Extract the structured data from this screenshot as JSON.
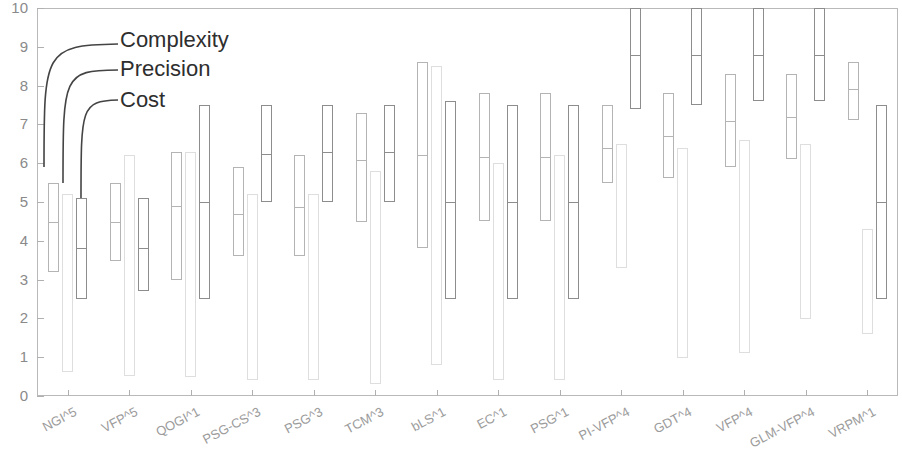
{
  "chart_data": {
    "type": "bar",
    "title": "",
    "xlabel": "",
    "ylabel": "",
    "ylim": [
      0,
      10
    ],
    "yticks": [
      "0",
      "1",
      "2",
      "3",
      "4",
      "5",
      "6",
      "7",
      "8",
      "9",
      "10"
    ],
    "grid": false,
    "legend_position": "upper-left-inside",
    "legend": [
      "Complexity",
      "Precision",
      "Cost"
    ],
    "series_colors": {
      "Complexity": "#b4b4b4",
      "Cost": "#dedede",
      "Precision": "#8d8d8d"
    },
    "bar_order": [
      "Complexity",
      "Cost",
      "Precision"
    ],
    "categories": [
      "NGI^5",
      "VFP^5",
      "QOGI^1",
      "PSG-CS^3",
      "PSG^3",
      "TCM^3",
      "bLS^1",
      "EC^1",
      "PSG^1",
      "PI-VFP^4",
      "GDT^4",
      "VFP^4",
      "GLM-VFP^4",
      "VRPM^1"
    ],
    "series": [
      {
        "name": "Complexity",
        "boxes": [
          {
            "low": 3.2,
            "high": 5.5,
            "median": 4.5
          },
          {
            "low": 3.5,
            "high": 5.5,
            "median": 4.5
          },
          {
            "low": 3.0,
            "high": 6.3,
            "median": 4.9
          },
          {
            "low": 3.6,
            "high": 5.9,
            "median": 4.7
          },
          {
            "low": 3.6,
            "high": 6.2,
            "median": 4.85
          },
          {
            "low": 4.5,
            "high": 7.3,
            "median": 6.1
          },
          {
            "low": 3.8,
            "high": 8.6,
            "median": 6.2
          },
          {
            "low": 4.5,
            "high": 7.8,
            "median": 6.15
          },
          {
            "low": 4.5,
            "high": 7.8,
            "median": 6.15
          },
          {
            "low": 5.5,
            "high": 7.5,
            "median": 6.4
          },
          {
            "low": 5.6,
            "high": 7.8,
            "median": 6.7
          },
          {
            "low": 5.9,
            "high": 8.3,
            "median": 7.1
          },
          {
            "low": 6.1,
            "high": 8.3,
            "median": 7.2
          },
          {
            "low": 7.1,
            "high": 8.6,
            "median": 7.9
          }
        ]
      },
      {
        "name": "Cost",
        "boxes": [
          {
            "low": 0.6,
            "high": 5.2,
            "median": null
          },
          {
            "low": 0.5,
            "high": 6.2,
            "median": null
          },
          {
            "low": 0.5,
            "high": 6.3,
            "median": null
          },
          {
            "low": 0.4,
            "high": 5.2,
            "median": null
          },
          {
            "low": 0.4,
            "high": 5.2,
            "median": null
          },
          {
            "low": 0.3,
            "high": 5.8,
            "median": null
          },
          {
            "low": 0.8,
            "high": 8.5,
            "median": null
          },
          {
            "low": 0.4,
            "high": 6.0,
            "median": null
          },
          {
            "low": 0.4,
            "high": 6.2,
            "median": null
          },
          {
            "low": 3.3,
            "high": 6.5,
            "median": null
          },
          {
            "low": 1.0,
            "high": 6.4,
            "median": null
          },
          {
            "low": 1.1,
            "high": 6.6,
            "median": null
          },
          {
            "low": 2.0,
            "high": 6.5,
            "median": null
          },
          {
            "low": 1.6,
            "high": 4.3,
            "median": null
          }
        ]
      },
      {
        "name": "Precision",
        "boxes": [
          {
            "low": 2.5,
            "high": 5.1,
            "median": 3.8
          },
          {
            "low": 2.7,
            "high": 5.1,
            "median": 3.8
          },
          {
            "low": 2.5,
            "high": 7.5,
            "median": 5.0
          },
          {
            "low": 5.0,
            "high": 7.5,
            "median": 6.25
          },
          {
            "low": 5.0,
            "high": 7.5,
            "median": 6.3
          },
          {
            "low": 5.0,
            "high": 7.5,
            "median": 6.3
          },
          {
            "low": 2.5,
            "high": 7.6,
            "median": 5.0
          },
          {
            "low": 2.5,
            "high": 7.5,
            "median": 5.0
          },
          {
            "low": 2.5,
            "high": 7.5,
            "median": 5.0
          },
          {
            "low": 7.4,
            "high": 10.0,
            "median": 8.8
          },
          {
            "low": 7.5,
            "high": 10.0,
            "median": 8.8
          },
          {
            "low": 7.6,
            "high": 10.0,
            "median": 8.8
          },
          {
            "low": 7.6,
            "high": 10.0,
            "median": 8.8
          },
          {
            "low": 2.5,
            "high": 7.5,
            "median": 5.0
          }
        ]
      }
    ]
  },
  "legend": {
    "complexity_label": "Complexity",
    "precision_label": "Precision",
    "cost_label": "Cost"
  }
}
